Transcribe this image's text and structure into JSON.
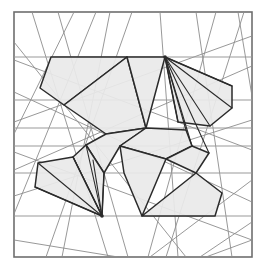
{
  "figure": {
    "caption": "",
    "canvas": {
      "width": 269,
      "height": 280,
      "background": "#ffffff"
    },
    "frame": {
      "name": "plot-border",
      "x": 14,
      "y": 12,
      "width": 238,
      "height": 245,
      "stroke": "#6e6e6e",
      "stroke_width": 1.6,
      "fill": "#ffffff"
    },
    "style": {
      "polygon_fill": "#e9e9e9",
      "polygon_stroke": "#2b2b2b",
      "polygon_stroke_width": 1.5,
      "fan_line_stroke": "#2b2b2b",
      "fan_line_width": 1.1,
      "grid_line_stroke": "#9a9a9a",
      "grid_line_width": 1.2,
      "arrangement_line_stroke": "#8c8c8c",
      "arrangement_line_width": 0.9
    }
  },
  "chart_data": {
    "type": "diagram",
    "xlabel": "",
    "ylabel": "",
    "xlim": [
      14,
      252
    ],
    "ylim": [
      12,
      257
    ],
    "grid": true,
    "legend": "none",
    "fan_apexes": [
      {
        "name": "apex-top-right",
        "x": 165,
        "y": 57
      },
      {
        "name": "apex-bottom-left",
        "x": 102,
        "y": 216
      }
    ],
    "horizontal_lines": [
      {
        "y": 57,
        "x0": 14,
        "x1": 252
      },
      {
        "y": 100,
        "x0": 14,
        "x1": 252
      },
      {
        "y": 128,
        "x0": 14,
        "x1": 252
      },
      {
        "y": 146,
        "x0": 14,
        "x1": 252
      },
      {
        "y": 173,
        "x0": 14,
        "x1": 252
      },
      {
        "y": 216,
        "x0": 14,
        "x1": 252
      }
    ],
    "polygons": [
      {
        "name": "polygon-top-left",
        "points": "51,57 127,57 64,105 40,88"
      },
      {
        "name": "polygon-upper-left-mid",
        "points": "127,57 146,128 106,134 64,105"
      },
      {
        "name": "polygon-upper-right-wedge",
        "points": "165,57 146,128 127,57"
      },
      {
        "name": "polygon-right-upper",
        "points": "165,57 232,86 232,108 210,126 178,122"
      },
      {
        "name": "polygon-center-left",
        "points": "106,134 146,128 120,146 104,173 86,145"
      },
      {
        "name": "polygon-center-right",
        "points": "146,128 186,130 192,146 166,159 120,146"
      },
      {
        "name": "polygon-left-wing",
        "points": "86,145 104,173 102,216 73,157"
      },
      {
        "name": "polygon-bottom-left-quad",
        "points": "38,163 73,157 102,216 35,187"
      },
      {
        "name": "polygon-bottom-center",
        "points": "120,146 166,159 142,216 124,173"
      },
      {
        "name": "polygon-bottom-right",
        "points": "142,216 196,173 222,193 215,216"
      },
      {
        "name": "polygon-right-mid",
        "points": "166,159 192,146 209,153 196,173"
      }
    ],
    "fan_lines_top_right": [
      {
        "x1": 165,
        "y1": 57,
        "x2": 178,
        "y2": 122
      },
      {
        "x1": 165,
        "y1": 57,
        "x2": 186,
        "y2": 130
      },
      {
        "x1": 165,
        "y1": 57,
        "x2": 192,
        "y2": 146
      },
      {
        "x1": 165,
        "y1": 57,
        "x2": 210,
        "y2": 126
      },
      {
        "x1": 165,
        "y1": 57,
        "x2": 232,
        "y2": 108
      },
      {
        "x1": 165,
        "y1": 57,
        "x2": 232,
        "y2": 86
      },
      {
        "x1": 165,
        "y1": 57,
        "x2": 209,
        "y2": 153
      }
    ],
    "fan_lines_bottom_left": [
      {
        "x1": 102,
        "y1": 216,
        "x2": 86,
        "y2": 145
      },
      {
        "x1": 102,
        "y1": 216,
        "x2": 73,
        "y2": 157
      },
      {
        "x1": 102,
        "y1": 216,
        "x2": 38,
        "y2": 163
      },
      {
        "x1": 102,
        "y1": 216,
        "x2": 35,
        "y2": 187
      },
      {
        "x1": 102,
        "y1": 216,
        "x2": 104,
        "y2": 173
      },
      {
        "x1": 102,
        "y1": 216,
        "x2": 93,
        "y2": 160
      }
    ],
    "arrangement_lines": [
      {
        "x1": 14,
        "y1": 122,
        "x2": 252,
        "y2": 36
      },
      {
        "x1": 14,
        "y1": 92,
        "x2": 252,
        "y2": 202
      },
      {
        "x1": 14,
        "y1": 170,
        "x2": 252,
        "y2": 66
      },
      {
        "x1": 32,
        "y1": 12,
        "x2": 108,
        "y2": 257
      },
      {
        "x1": 58,
        "y1": 12,
        "x2": 128,
        "y2": 257
      },
      {
        "x1": 96,
        "y1": 12,
        "x2": 14,
        "y2": 214
      },
      {
        "x1": 132,
        "y1": 12,
        "x2": 46,
        "y2": 257
      },
      {
        "x1": 160,
        "y1": 12,
        "x2": 178,
        "y2": 257
      },
      {
        "x1": 196,
        "y1": 12,
        "x2": 232,
        "y2": 257
      },
      {
        "x1": 216,
        "y1": 12,
        "x2": 148,
        "y2": 257
      },
      {
        "x1": 244,
        "y1": 12,
        "x2": 166,
        "y2": 257
      },
      {
        "x1": 14,
        "y1": 60,
        "x2": 252,
        "y2": 150
      },
      {
        "x1": 14,
        "y1": 196,
        "x2": 252,
        "y2": 120
      },
      {
        "x1": 14,
        "y1": 42,
        "x2": 186,
        "y2": 257
      },
      {
        "x1": 74,
        "y1": 12,
        "x2": 14,
        "y2": 134
      },
      {
        "x1": 252,
        "y1": 180,
        "x2": 150,
        "y2": 257
      },
      {
        "x1": 238,
        "y1": 12,
        "x2": 252,
        "y2": 96
      },
      {
        "x1": 110,
        "y1": 12,
        "x2": 62,
        "y2": 257
      },
      {
        "x1": 14,
        "y1": 240,
        "x2": 118,
        "y2": 257
      },
      {
        "x1": 200,
        "y1": 257,
        "x2": 252,
        "y2": 222
      },
      {
        "x1": 252,
        "y1": 240,
        "x2": 206,
        "y2": 257
      },
      {
        "x1": 14,
        "y1": 152,
        "x2": 252,
        "y2": 240
      }
    ]
  }
}
